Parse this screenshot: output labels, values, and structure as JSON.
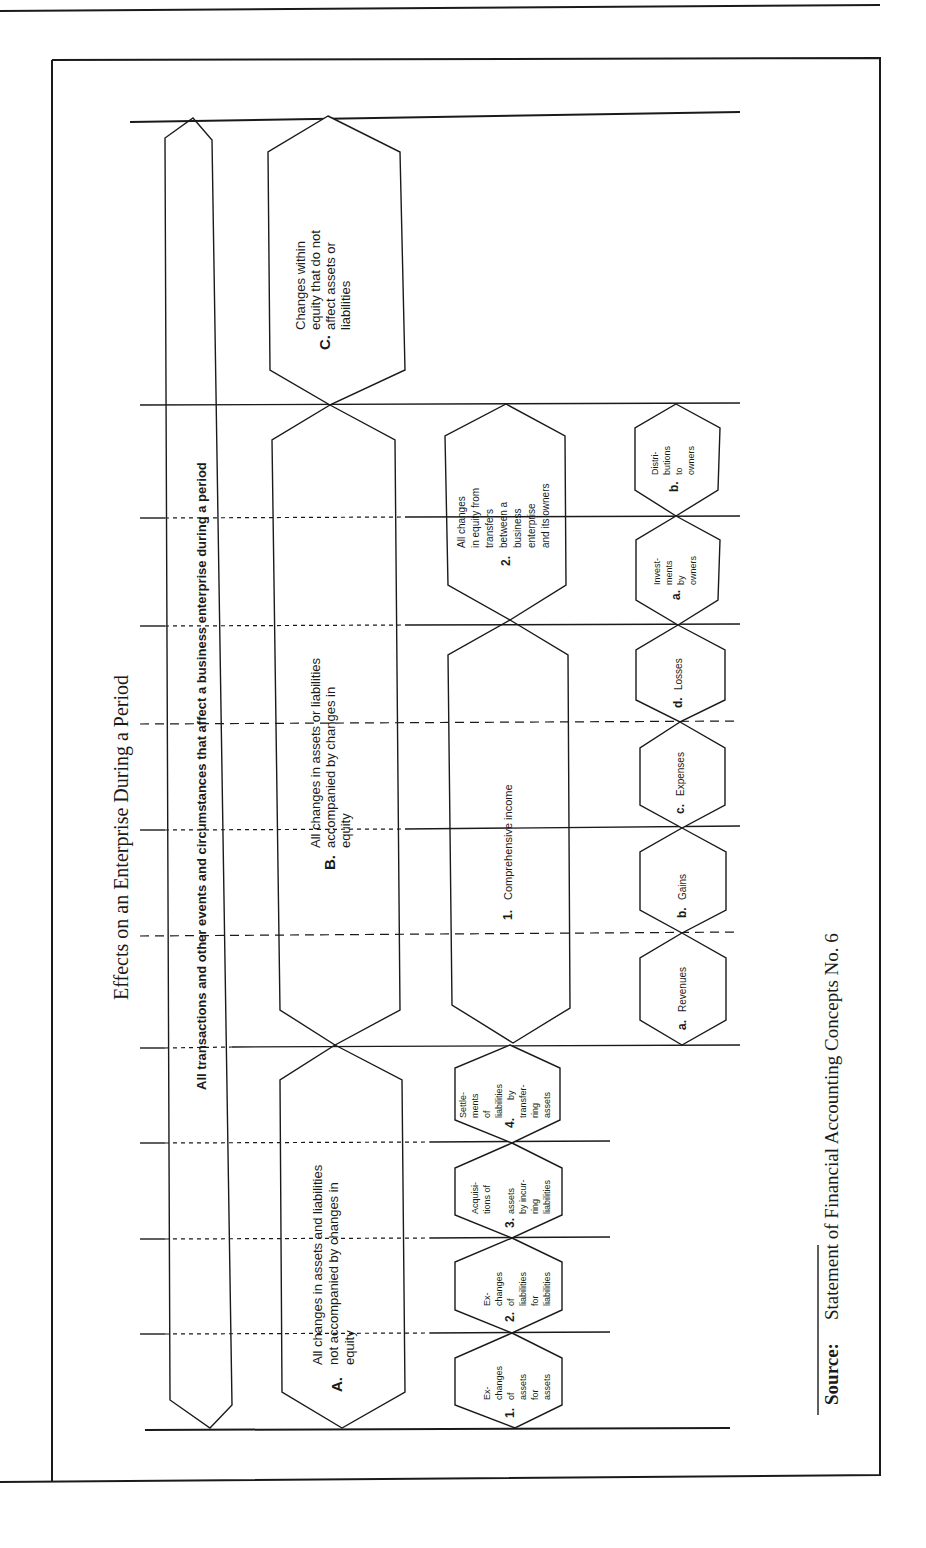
{
  "document": {
    "title": "Effects on an Enterprise During a Period",
    "source_label": "Source:",
    "source_text": "Statement of Financial Accounting Concepts No. 6"
  },
  "diagram": {
    "outer_band": {
      "label": "All transactions and other events and circumstances that affect a business enterprise during a period"
    },
    "categories": [
      {
        "marker": "A.",
        "lines": [
          "All changes in assets and liabilities",
          "not accompanied by changes in",
          "equity"
        ],
        "children": [
          {
            "marker": "1.",
            "lines": [
              "Ex-",
              "changes",
              "of",
              "assets",
              "for",
              "assets"
            ]
          },
          {
            "marker": "2.",
            "lines": [
              "Ex-",
              "changes",
              "of",
              "liabilities",
              "for",
              "liabilities"
            ]
          },
          {
            "marker": "3.",
            "lines": [
              "Acquisi-",
              "tions of",
              "assets",
              "by incur-",
              "ring",
              "liabilities"
            ]
          },
          {
            "marker": "4.",
            "lines": [
              "Settle-",
              "ments",
              "of",
              "liabilities",
              "by",
              "transfer-",
              "ring",
              "assets"
            ]
          }
        ]
      },
      {
        "marker": "B.",
        "lines": [
          "All changes in assets or liabilities",
          "accompanied by changes in",
          "equity"
        ],
        "children": [
          {
            "marker": "1.",
            "lines": [
              "Comprehensive income"
            ],
            "children": [
              {
                "marker": "a.",
                "label": "Revenues"
              },
              {
                "marker": "b.",
                "label": "Gains"
              },
              {
                "marker": "c.",
                "label": "Expenses"
              },
              {
                "marker": "d.",
                "label": "Losses"
              }
            ]
          },
          {
            "marker": "2.",
            "lines": [
              "All changes",
              "in equity from",
              "transfers",
              "between a",
              "business",
              "enterprise",
              "and its owners"
            ],
            "children": [
              {
                "marker": "a.",
                "lines": [
                  "Invest-",
                  "ments",
                  "by",
                  "owners"
                ]
              },
              {
                "marker": "b.",
                "lines": [
                  "Distri-",
                  "butions",
                  "to",
                  "owners"
                ]
              }
            ]
          }
        ]
      },
      {
        "marker": "C.",
        "lines": [
          "Changes within",
          "equity that do not",
          "affect assets or",
          "liabilities"
        ],
        "children": []
      }
    ]
  },
  "colors": {
    "ink": "#1a1a1a",
    "paper": "#ffffff"
  }
}
